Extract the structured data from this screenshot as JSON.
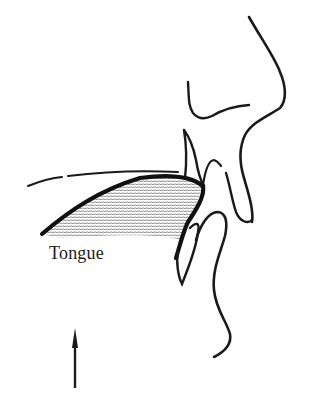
{
  "diagram": {
    "type": "sagittal sketch of mouth and nose profile",
    "labels": {
      "tongue": "Tongue"
    },
    "arrow": {
      "direction": "up"
    },
    "colors": {
      "ink": "#1a1a1a",
      "shading": "#555555",
      "background": "#ffffff"
    }
  }
}
